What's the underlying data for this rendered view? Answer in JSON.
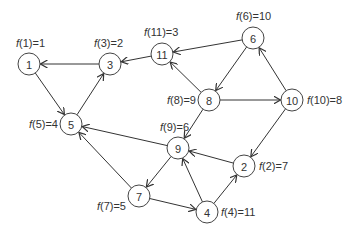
{
  "diagram": {
    "type": "directed-graph",
    "node_radius": 11,
    "nodes": [
      {
        "id": "1",
        "x": 29,
        "y": 64,
        "label": "f(1)=1",
        "label_x": 16,
        "label_y": 47,
        "label_anchor": "start"
      },
      {
        "id": "3",
        "x": 110,
        "y": 64,
        "label": "f(3)=2",
        "label_x": 94,
        "label_y": 47,
        "label_anchor": "start"
      },
      {
        "id": "11",
        "x": 162,
        "y": 54,
        "label": "f(11)=3",
        "label_x": 144,
        "label_y": 36,
        "label_anchor": "start"
      },
      {
        "id": "6",
        "x": 253,
        "y": 38,
        "label": "f(6)=10",
        "label_x": 236,
        "label_y": 20,
        "label_anchor": "start"
      },
      {
        "id": "8",
        "x": 209,
        "y": 100,
        "label": "f(8)=9",
        "label_x": 196,
        "label_y": 104,
        "label_anchor": "end"
      },
      {
        "id": "10",
        "x": 292,
        "y": 100,
        "label": "f(10)=8",
        "label_x": 307,
        "label_y": 104,
        "label_anchor": "start"
      },
      {
        "id": "5",
        "x": 71,
        "y": 124,
        "label": "f(5)=4",
        "label_x": 58,
        "label_y": 128,
        "label_anchor": "end"
      },
      {
        "id": "9",
        "x": 178,
        "y": 148,
        "label": "f(9)=6",
        "label_x": 160,
        "label_y": 131,
        "label_anchor": "start"
      },
      {
        "id": "2",
        "x": 244,
        "y": 166,
        "label": "f(2)=7",
        "label_x": 259,
        "label_y": 170,
        "label_anchor": "start"
      },
      {
        "id": "7",
        "x": 139,
        "y": 196,
        "label": "f(7)=5",
        "label_x": 126,
        "label_y": 210,
        "label_anchor": "end"
      },
      {
        "id": "4",
        "x": 207,
        "y": 212,
        "label": "f(4)=11",
        "label_x": 221,
        "label_y": 216,
        "label_anchor": "start"
      }
    ],
    "edges": [
      {
        "from": "3",
        "to": "1"
      },
      {
        "from": "1",
        "to": "5"
      },
      {
        "from": "5",
        "to": "3"
      },
      {
        "from": "11",
        "to": "3"
      },
      {
        "from": "6",
        "to": "11"
      },
      {
        "from": "6",
        "to": "8"
      },
      {
        "from": "8",
        "to": "11"
      },
      {
        "from": "8",
        "to": "10"
      },
      {
        "from": "10",
        "to": "6"
      },
      {
        "from": "8",
        "to": "9"
      },
      {
        "from": "10",
        "to": "2"
      },
      {
        "from": "9",
        "to": "5"
      },
      {
        "from": "2",
        "to": "9"
      },
      {
        "from": "9",
        "to": "7"
      },
      {
        "from": "7",
        "to": "5"
      },
      {
        "from": "7",
        "to": "4"
      },
      {
        "from": "4",
        "to": "9"
      },
      {
        "from": "4",
        "to": "2"
      }
    ],
    "colors": {
      "node_stroke": "#444444",
      "node_fill": "#ffffff",
      "edge": "#333333",
      "text": "#333333"
    }
  }
}
